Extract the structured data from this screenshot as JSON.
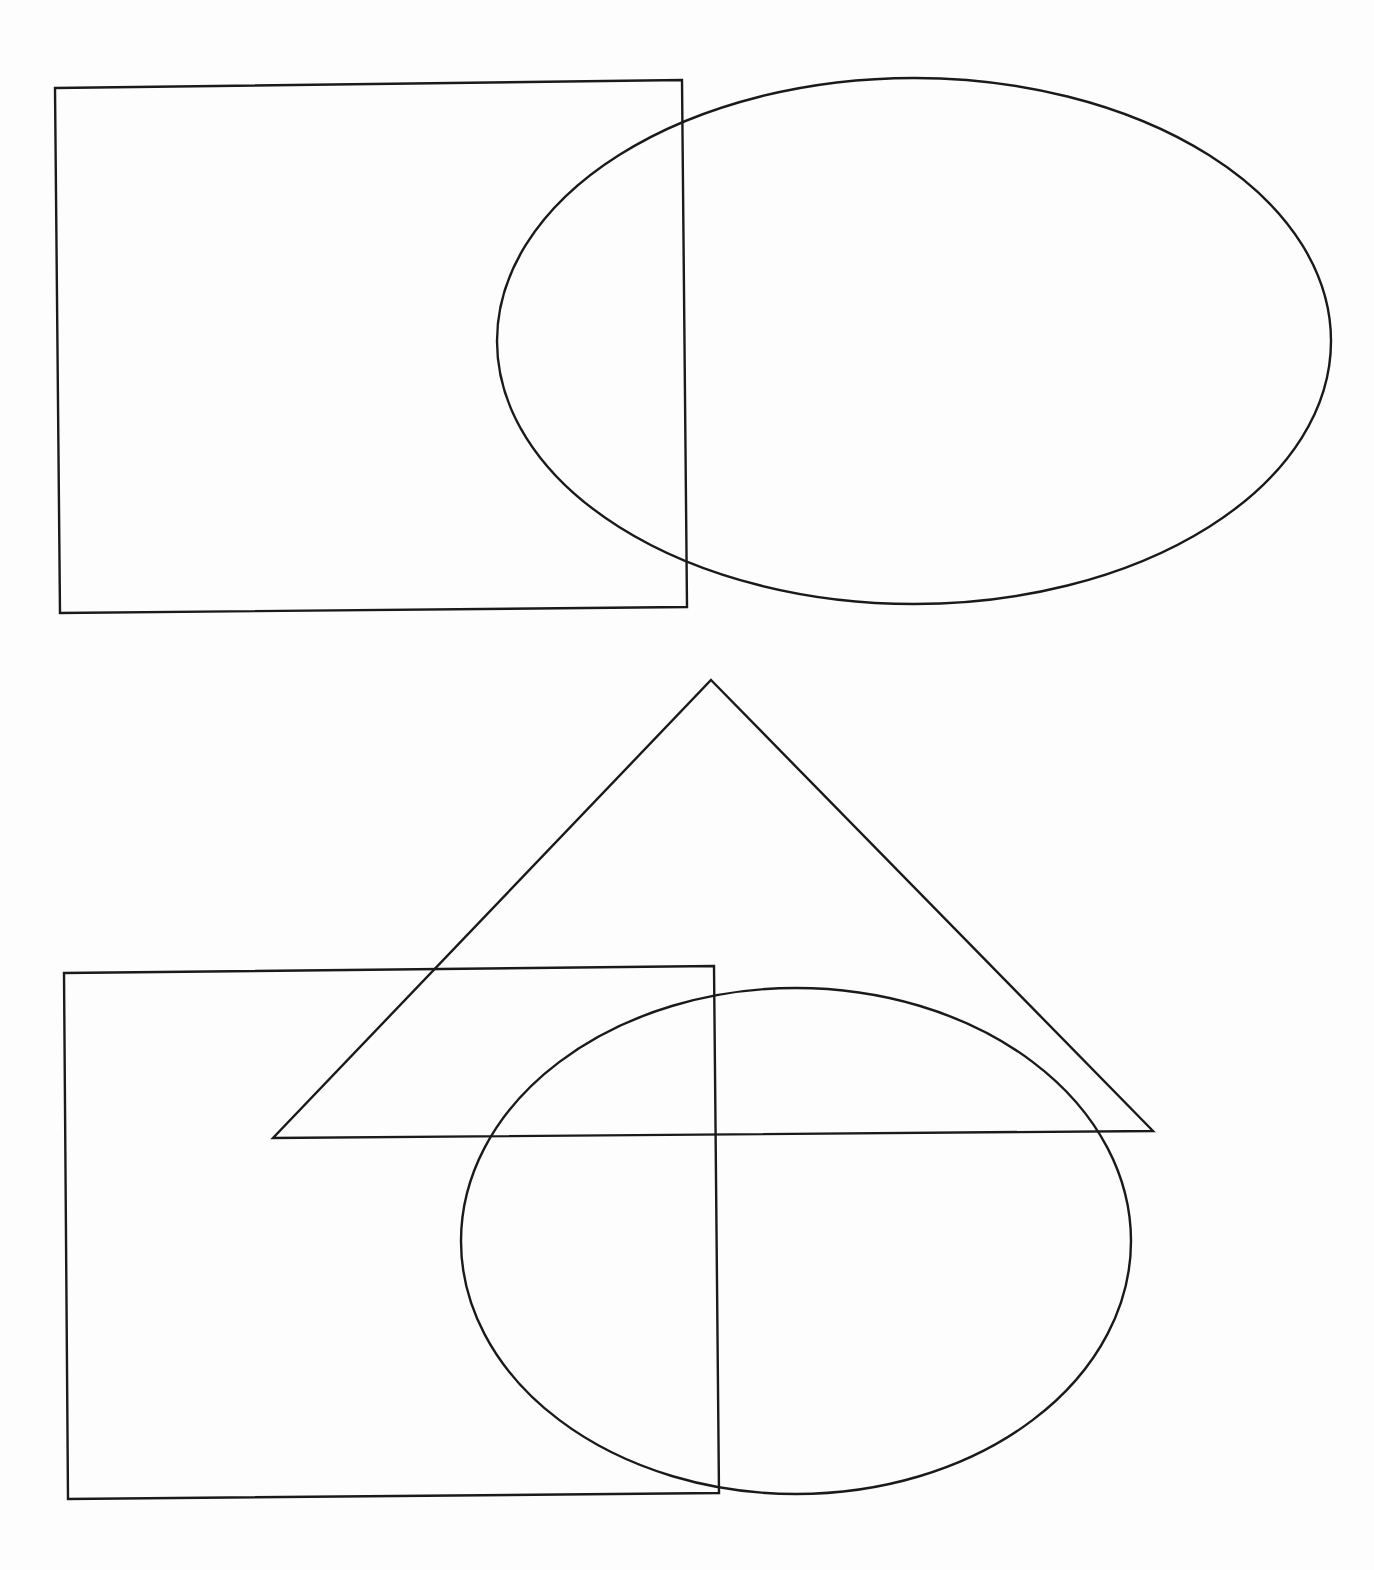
{
  "page": {
    "width": 1374,
    "height": 1570,
    "background": "#fdfdfd",
    "stroke_color": "#1a1a1a",
    "stroke_width": 2.4
  },
  "diagram": {
    "type": "geometric-shapes-line-drawing",
    "shapes": [
      {
        "id": "rectangle-top",
        "kind": "quadrilateral",
        "points": [
          [
            55,
            88
          ],
          [
            682,
            80
          ],
          [
            687,
            607
          ],
          [
            60,
            613
          ]
        ]
      },
      {
        "id": "ellipse-top",
        "kind": "ellipse",
        "cx": 914,
        "cy": 341,
        "rx": 417,
        "ry": 263,
        "rotation": 0
      },
      {
        "id": "triangle",
        "kind": "triangle",
        "points": [
          [
            711,
            680
          ],
          [
            1153,
            1131
          ],
          [
            273,
            1138
          ]
        ]
      },
      {
        "id": "rectangle-bottom",
        "kind": "quadrilateral",
        "points": [
          [
            64,
            973
          ],
          [
            714,
            966
          ],
          [
            719,
            1493
          ],
          [
            68,
            1499
          ]
        ]
      },
      {
        "id": "ellipse-bottom",
        "kind": "ellipse",
        "cx": 796,
        "cy": 1241,
        "rx": 335,
        "ry": 253,
        "rotation": 0
      }
    ]
  }
}
